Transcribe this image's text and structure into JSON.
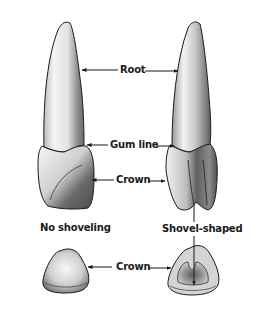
{
  "figure": {
    "labels": {
      "root": "Root",
      "gum_line": "Gum line",
      "crown_side": "Crown",
      "crown_top": "Crown"
    },
    "captions": {
      "left": "No shoveling",
      "right": "Shovel-shaped"
    },
    "colors": {
      "ink": "#1a1a1a",
      "background": "#ffffff",
      "shade_dark": "#555555",
      "shade_light": "#e8e8e8"
    }
  }
}
